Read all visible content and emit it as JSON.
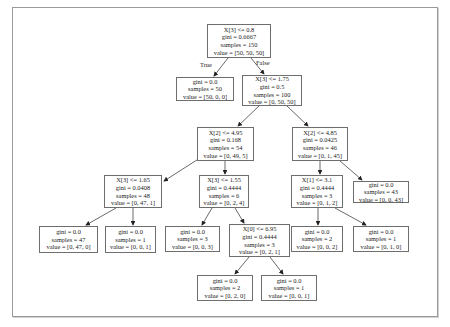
{
  "tree": {
    "edge_labels": {
      "true": "True",
      "false": "False"
    },
    "nodes": {
      "root": {
        "split": "X[3] <= 0.8",
        "gini": "gini = 0.6667",
        "samples": "samples = 150",
        "value": "value = [50, 50, 50]"
      },
      "n1": {
        "gini": "gini = 0.0",
        "samples": "samples = 50",
        "value": "value = [50, 0, 0]"
      },
      "n2": {
        "split": "X[3] <= 1.75",
        "gini": "gini = 0.5",
        "samples": "samples = 100",
        "value": "value = [0, 50, 50]"
      },
      "n3": {
        "split": "X[2] <= 4.95",
        "gini": "gini = 0.168",
        "samples": "samples = 54",
        "value": "value = [0, 49, 5]"
      },
      "n4": {
        "split": "X[2] <= 4.85",
        "gini": "gini = 0.0425",
        "samples": "samples = 46",
        "value": "value = [0, 1, 45]"
      },
      "n5": {
        "split": "X[3] <= 1.65",
        "gini": "gini = 0.0408",
        "samples": "samples = 48",
        "value": "value = [0, 47, 1]"
      },
      "n6": {
        "split": "X[3] <= 1.55",
        "gini": "gini = 0.4444",
        "samples": "samples = 6",
        "value": "value = [0, 2, 4]"
      },
      "n7": {
        "split": "X[1] <= 3.1",
        "gini": "gini = 0.4444",
        "samples": "samples = 3",
        "value": "value = [0, 1, 2]"
      },
      "n8": {
        "gini": "gini = 0.0",
        "samples": "samples = 43",
        "value": "value = [0, 0, 43]"
      },
      "n9": {
        "gini": "gini = 0.0",
        "samples": "samples = 47",
        "value": "value = [0, 47, 0]"
      },
      "n10": {
        "gini": "gini = 0.0",
        "samples": "samples = 1",
        "value": "value = [0, 0, 1]"
      },
      "n11": {
        "gini": "gini = 0.0",
        "samples": "samples = 3",
        "value": "value = [0, 0, 3]"
      },
      "n12": {
        "split": "X[0] <= 6.95",
        "gini": "gini = 0.4444",
        "samples": "samples = 3",
        "value": "value = [0, 2, 1]"
      },
      "n13": {
        "gini": "gini = 0.0",
        "samples": "samples = 2",
        "value": "value = [0, 0, 2]"
      },
      "n14": {
        "gini": "gini = 0.0",
        "samples": "samples = 1",
        "value": "value = [0, 1, 0]"
      },
      "n15": {
        "gini": "gini = 0.0",
        "samples": "samples = 2",
        "value": "value = [0, 2, 0]"
      },
      "n16": {
        "gini": "gini = 0.0",
        "samples": "samples = 1",
        "value": "value = [0, 0, 1]"
      }
    }
  }
}
